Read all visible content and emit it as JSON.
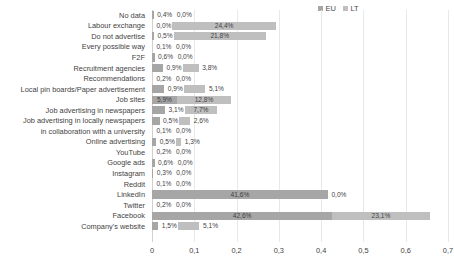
{
  "chart_data": {
    "type": "bar",
    "orientation": "horizontal",
    "stacked": true,
    "title": "",
    "subtitle": "",
    "xlabel": "",
    "ylabel": "",
    "xlim": [
      0,
      0.7
    ],
    "xticks": [
      "0",
      "0,1",
      "0,2",
      "0,3",
      "0,4",
      "0,5",
      "0,6",
      "0,7"
    ],
    "xtick_values": [
      0,
      0.1,
      0.2,
      0.3,
      0.4,
      0.5,
      0.6,
      0.7
    ],
    "grid": true,
    "legend_position": "top-right",
    "categories": [
      "No data",
      "Labour exchange",
      "Do not advertise",
      "Every possible way",
      "F2F",
      "Recruitment agencies",
      "Recommendations",
      "Local pin boards/Paper advertisement",
      "Job sites",
      "Job advertising in newspapers",
      "Job advertising in locally newspapers",
      "in collaboration with a university",
      "Online advertising",
      "YouTube",
      "Google ads",
      "Instagram",
      "Reddit",
      "LinkedIn",
      "Twitter",
      "Facebook",
      "Company's website"
    ],
    "series": [
      {
        "name": "EU",
        "color": "#a6a6a6",
        "values": [
          0.004,
          0.0,
          0.005,
          0.001,
          0.006,
          0.026,
          0.002,
          0.029,
          0.059,
          0.031,
          0.018,
          0.001,
          0.01,
          0.002,
          0.006,
          0.003,
          0.001,
          0.416,
          0.002,
          0.426,
          0.015
        ],
        "labels": [
          "0,4%",
          "0,0%",
          "0,5%",
          "0,1%",
          "0,6%",
          "",
          "0,2%",
          "",
          "5,9%",
          "3,1%",
          "",
          "0,1%",
          "",
          "0,2%",
          "0,6%",
          "0,3%",
          "0,1%",
          "41,6%",
          "0,2%",
          "42,6%",
          "1,5%"
        ]
      },
      {
        "name": "LT",
        "color": "#bfbfbf",
        "values": [
          0.0,
          0.244,
          0.218,
          0.0,
          0.0,
          0.038,
          0.0,
          0.051,
          0.128,
          0.077,
          0.026,
          0.0,
          0.013,
          0.0,
          0.0,
          0.0,
          0.0,
          0.0,
          0.0,
          0.231,
          0.051
        ],
        "labels": [
          "0,0%",
          "24,4%",
          "21,8%",
          "0,0%",
          "0,0%",
          "3,8%",
          "0,0%",
          "5,1%",
          "12,8%",
          "7,7%",
          "2,6%",
          "0,0%",
          "1,3%",
          "0,0%",
          "0,0%",
          "0,0%",
          "0,0%",
          "0,0%",
          "0,0%",
          "23,1%",
          "5,1%"
        ]
      }
    ],
    "eu_value_labels": [
      "0,4%",
      "0,0%",
      "0,5%",
      "0,1%",
      "0,6%",
      "0,9%",
      "0,2%",
      "0,9%",
      "5,9%",
      "3,1%",
      "0,5%",
      "0,1%",
      "0,5%",
      "0,2%",
      "0,6%",
      "0,3%",
      "0,1%",
      "41,6%",
      "0,2%",
      "42,6%",
      "1,5%"
    ],
    "lt_value_labels": [
      "0,0%",
      "24,4%",
      "21,8%",
      "0,0%",
      "0,0%",
      "3,8%",
      "0,0%",
      "5,1%",
      "12,8%",
      "7,7%",
      "2,6%",
      "0,0%",
      "1,3%",
      "0,0%",
      "0,0%",
      "0,0%",
      "0,0%",
      "0,0%",
      "0,0%",
      "23,1%",
      "5,1%"
    ]
  },
  "legend": {
    "items": [
      {
        "label": "EU",
        "color": "#a6a6a6"
      },
      {
        "label": "LT",
        "color": "#bfbfbf"
      }
    ]
  }
}
